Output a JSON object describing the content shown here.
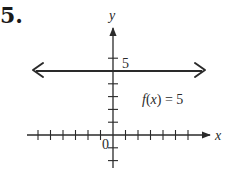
{
  "problem": {
    "number_label": "5."
  },
  "chart_data": {
    "type": "line",
    "title": "",
    "xlabel": "x",
    "ylabel": "y",
    "origin_label": "0",
    "function_label": "f(x) = 5",
    "function": "f(x) = 5",
    "y_tick_labels": [
      {
        "value": 5,
        "label": "5"
      }
    ],
    "xlim": [
      -6,
      7
    ],
    "ylim": [
      -2,
      7
    ],
    "x_ticks": [
      -6,
      -5,
      -4,
      -3,
      -2,
      -1,
      1,
      2,
      3,
      4,
      5,
      6
    ],
    "y_ticks": [
      -2,
      -1,
      1,
      2,
      3,
      4,
      5,
      6
    ],
    "grid": false,
    "series": [
      {
        "name": "f(x) = 5",
        "x": [
          -6.3,
          7.1
        ],
        "y": [
          5,
          5
        ],
        "arrows_both_ends": true
      }
    ]
  },
  "style": {
    "ink_color": "#2a2a2a",
    "background": "#ffffff"
  }
}
